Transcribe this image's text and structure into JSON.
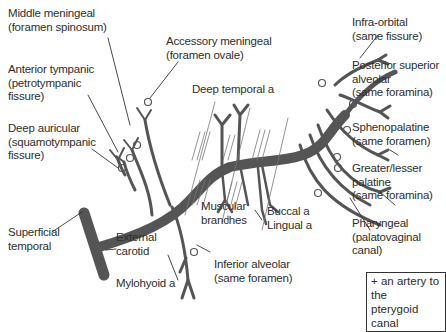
{
  "diagram": {
    "vessel_color": "#555555",
    "labels": {
      "middle_meningeal": {
        "line1": "Middle meningeal",
        "line2": "(foramen spinosum)"
      },
      "anterior_tympanic": {
        "line1": "Anterior tympanic",
        "line2": "(petrotympanic",
        "line3": "fissure)"
      },
      "deep_auricular": {
        "line1": "Deep auricular",
        "line2": "(squamotympanic",
        "line3": "fissure)"
      },
      "superficial_temporal": {
        "line1": "Superficial",
        "line2": "temporal"
      },
      "external_carotid": {
        "line1": "External",
        "line2": "carotid"
      },
      "mylohyoid": {
        "line1": "Mylohyoid a"
      },
      "accessory_meningeal": {
        "line1": "Accessory meningeal",
        "line2": "(foramen ovale)"
      },
      "deep_temporal": {
        "line1": "Deep temporal a"
      },
      "muscular_branches": {
        "line1": "Muscular",
        "line2": "branches"
      },
      "buccal_lingual": {
        "line1": "Buccal a",
        "line2": "Lingual a"
      },
      "inferior_alveolar": {
        "line1": "Inferior alveolar",
        "line2": "(same foramen)"
      },
      "infra_orbital": {
        "line1": "Infra-orbital",
        "line2": "(same fissure)"
      },
      "posterior_superior_alveolar": {
        "line1": "Posterior superior",
        "line2": "alveolar",
        "line3": "(same foramina)"
      },
      "sphenopalatine": {
        "line1": "Sphenopalatine",
        "line2": "(same  foramen)"
      },
      "greater_lesser_palatine": {
        "line1": "Greater/lesser",
        "line2": "palatine",
        "line3": "(same foramina)"
      },
      "pharyngeal": {
        "line1": "Pharyngeal",
        "line2": "(palatovaginal",
        "line3": "canal)"
      }
    },
    "note_box": {
      "line1": "+ an artery to the",
      "line2": "pterygoid canal"
    }
  }
}
